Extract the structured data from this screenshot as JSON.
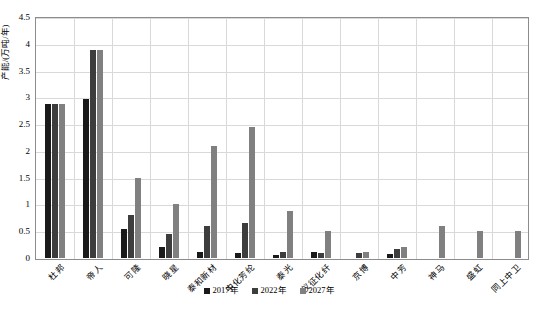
{
  "chart_data": {
    "type": "bar",
    "title": "",
    "subtitle": "",
    "xlabel": "",
    "ylabel": "产能/(万吨/年)",
    "ylim": [
      0,
      4.5
    ],
    "ytick_step": 0.5,
    "yticks": [
      "0",
      "0.5",
      "1",
      "1.5",
      "2",
      "2.5",
      "3",
      "3.5",
      "4",
      "4.5"
    ],
    "grid": true,
    "legend_position": "bottom",
    "categories": [
      "杜邦",
      "帝人",
      "可隆",
      "晓星",
      "泰和新材",
      "中化芳纶",
      "泰光",
      "仪征化纤",
      "京博",
      "中芳",
      "神马",
      "盛虹",
      "同上中卫"
    ],
    "series": [
      {
        "name": "2017年",
        "color": "#1a1a1a",
        "values": [
          2.88,
          2.96,
          0.55,
          0.2,
          0.12,
          0.1,
          0.05,
          0.12,
          0.0,
          0.07,
          0.0,
          0.0,
          0.0
        ]
      },
      {
        "name": "2022年",
        "color": "#3d3d3d",
        "values": [
          2.88,
          3.88,
          0.8,
          0.45,
          0.6,
          0.65,
          0.12,
          0.1,
          0.1,
          0.17,
          0.0,
          0.0,
          0.0
        ]
      },
      {
        "name": "2027年",
        "color": "#808080",
        "values": [
          2.88,
          3.88,
          1.5,
          1.0,
          2.1,
          2.45,
          0.87,
          0.5,
          0.12,
          0.2,
          0.6,
          0.5,
          0.5
        ]
      }
    ]
  },
  "axis": {
    "frame_color": "#8c8c8c",
    "grid_color": "#d9d9d9"
  }
}
